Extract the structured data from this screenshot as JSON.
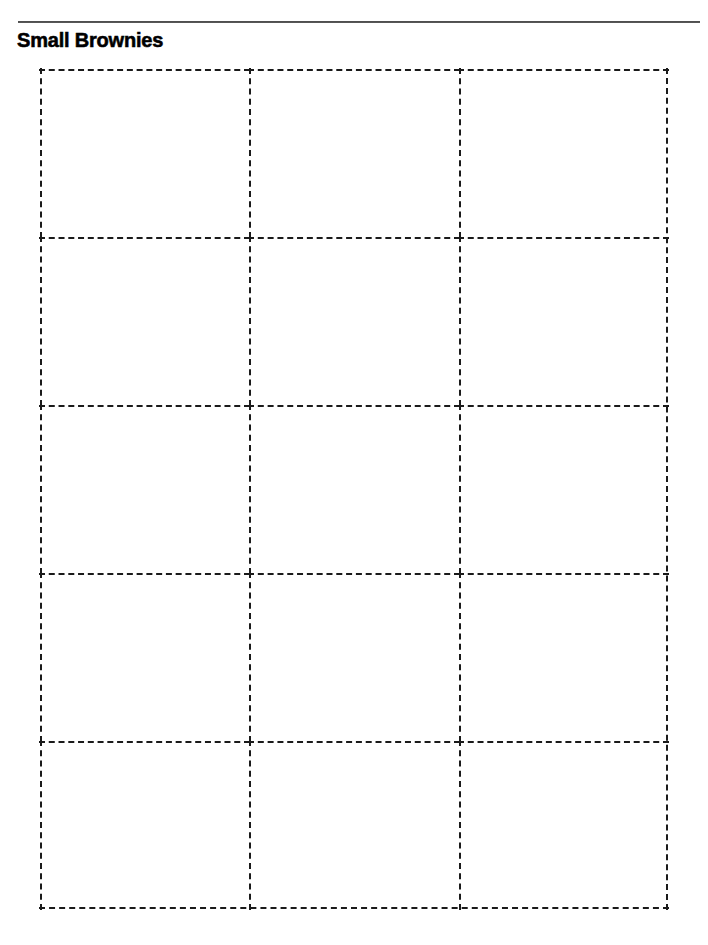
{
  "document": {
    "title": "Small Brownies",
    "kind": "printable-template-page",
    "background_color": "#ffffff",
    "ink_color": "#000000"
  },
  "header": {
    "rule": {
      "name": "horizontal-rule",
      "color": "#2b2b2b"
    },
    "title": "Small Brownies"
  },
  "grid": {
    "columns": 3,
    "rows": 5,
    "total_cells": 15,
    "border_style": "dashed",
    "border_color": "#1a1a1a",
    "cells": [
      {
        "id": "r1c1",
        "label": ""
      },
      {
        "id": "r1c2",
        "label": ""
      },
      {
        "id": "r1c3",
        "label": ""
      },
      {
        "id": "r2c1",
        "label": ""
      },
      {
        "id": "r2c2",
        "label": ""
      },
      {
        "id": "r2c3",
        "label": ""
      },
      {
        "id": "r3c1",
        "label": ""
      },
      {
        "id": "r3c2",
        "label": ""
      },
      {
        "id": "r3c3",
        "label": ""
      },
      {
        "id": "r4c1",
        "label": ""
      },
      {
        "id": "r4c2",
        "label": ""
      },
      {
        "id": "r4c3",
        "label": ""
      },
      {
        "id": "r5c1",
        "label": ""
      },
      {
        "id": "r5c2",
        "label": ""
      },
      {
        "id": "r5c3",
        "label": ""
      }
    ]
  }
}
